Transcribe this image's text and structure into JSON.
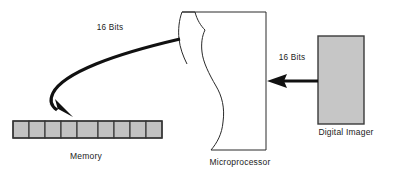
{
  "diagram": {
    "background_color": "#ffffff",
    "nodes": {
      "memory": {
        "label": "Memory",
        "cell_count": 9,
        "fill_color": "#c2c2c2",
        "stroke_color": "#333333"
      },
      "microprocessor": {
        "label": "Microprocessor",
        "fill_color": "#ffffff",
        "stroke_color": "#2a2a2a"
      },
      "digital_imager": {
        "label": "Digital Imager",
        "fill_color": "#c6c6c6",
        "stroke_color": "#3a3a3a"
      }
    },
    "connections": {
      "imager_to_cpu": {
        "label": "16 Bits",
        "direction": "right-to-left",
        "color": "#111111"
      },
      "cpu_to_memory": {
        "label": "16 Bits",
        "direction": "curved-left-down",
        "color": "#111111"
      }
    }
  }
}
